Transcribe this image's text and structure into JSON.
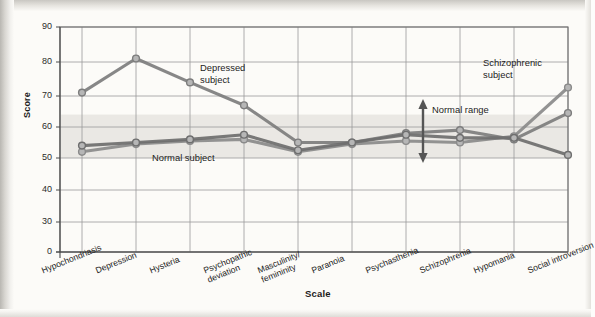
{
  "chart_data": {
    "type": "line",
    "title": "",
    "xlabel": "Scale",
    "ylabel": "Score",
    "ylim": [
      0,
      90
    ],
    "yticks": [
      0,
      30,
      40,
      50,
      60,
      70,
      80,
      90
    ],
    "axis_break": true,
    "grid": true,
    "legend_position": "inline-annotations",
    "categories": [
      "Hypochondriasis",
      "Depression",
      "Hysteria",
      "Psychopathic deviation",
      "Masculinity/femininity",
      "Paranoia",
      "Psychasthenia",
      "Schizophrenia",
      "Hypomania",
      "Social introversion"
    ],
    "category_lines": [
      [
        "Hypochondriasis"
      ],
      [
        "Depression"
      ],
      [
        "Hysteria"
      ],
      [
        "Psychopathic",
        "deviation"
      ],
      [
        "Masculinity/",
        "femininity"
      ],
      [
        "Paranoia"
      ],
      [
        "Psychasthenia"
      ],
      [
        "Schizophrenia"
      ],
      [
        "Hypomania"
      ],
      [
        "Social introversion"
      ]
    ],
    "series": [
      {
        "name": "Depressed subject",
        "color": "#7d7d7d",
        "values": [
          71,
          81,
          74,
          67,
          55,
          55,
          58,
          59,
          56,
          64.5
        ]
      },
      {
        "name": "Schizophrenic subject",
        "color": "#8a8a8a",
        "values": [
          52,
          54.5,
          55.5,
          56,
          52,
          54.5,
          55.5,
          55,
          57,
          72.5
        ]
      },
      {
        "name": "Normal subject",
        "color": "#6e6e6e",
        "values": [
          54,
          55,
          56,
          57.5,
          52.5,
          55,
          57.5,
          56.5,
          56.5,
          51
        ]
      }
    ],
    "bands": [
      {
        "name": "Normal range",
        "from": 50,
        "to": 64,
        "color": "#e6e4e0"
      }
    ],
    "annotations": [
      {
        "id": "depressed-label",
        "lines": [
          "Depressed",
          "subject"
        ],
        "x": 200,
        "y": 62
      },
      {
        "id": "schizophrenic-label",
        "lines": [
          "Schizophrenic",
          "subject"
        ],
        "x": 483,
        "y": 57
      },
      {
        "id": "normal-subject-label",
        "lines": [
          "Normal subject"
        ],
        "x": 152,
        "y": 152
      },
      {
        "id": "normal-range-label",
        "lines": [
          "Normal range"
        ],
        "x": 432,
        "y": 104
      }
    ],
    "normal_range_arrow": {
      "name": "normal-range-double-arrow",
      "x": 423,
      "top_y": 99,
      "bottom_y": 163
    }
  },
  "yticks_text": [
    "90",
    "80",
    "70",
    "60",
    "50",
    "40",
    "30",
    "0"
  ]
}
